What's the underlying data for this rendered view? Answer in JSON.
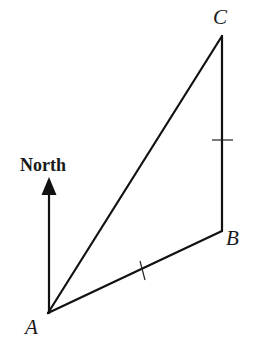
{
  "diagram": {
    "title": "",
    "north_arrow": {
      "label": "North",
      "tail": [
        49,
        313
      ],
      "tip": [
        49,
        177
      ]
    },
    "points": [
      {
        "name": "A",
        "x": 48,
        "y": 313,
        "label": "A"
      },
      {
        "name": "B",
        "x": 222,
        "y": 231,
        "label": "B"
      },
      {
        "name": "C",
        "x": 222,
        "y": 36,
        "label": "C"
      }
    ],
    "segments": [
      {
        "from": "A",
        "to": "B",
        "tick_marks": 1
      },
      {
        "from": "B",
        "to": "C",
        "tick_marks": 1
      },
      {
        "from": "A",
        "to": "C",
        "tick_marks": 0
      }
    ],
    "note": "Tick marks indicate AB = BC",
    "colors": {
      "stroke": "#111111",
      "background": "#ffffff"
    }
  }
}
